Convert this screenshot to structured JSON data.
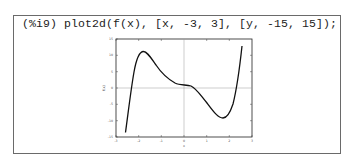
{
  "cell": {
    "prompt": "(%i9)",
    "command": "plot2d(f(x), [x, -3, 3], [y, -15, 15]);"
  },
  "plot": {
    "xlabel": "x",
    "ylabel": "f(x)",
    "xlim": [
      -3,
      3
    ],
    "ylim": [
      -15,
      15
    ],
    "xticks": [
      "-3",
      "-2",
      "-1",
      "0",
      "1",
      "2",
      "3"
    ],
    "yticks": [
      "15",
      "10",
      "5",
      "0",
      "-5",
      "-10",
      "-15"
    ],
    "line_color": "#111111"
  }
}
